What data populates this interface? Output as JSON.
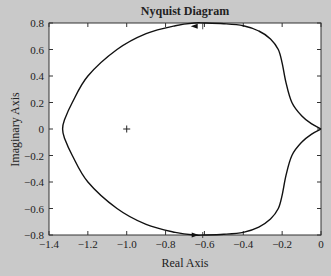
{
  "chart_data": {
    "type": "line",
    "title": "Nyquist Diagram",
    "xlabel": "Real Axis",
    "ylabel": "Imaginary Axis",
    "xlim": [
      -1.4,
      0
    ],
    "ylim": [
      -0.8,
      0.8
    ],
    "xticks": [
      -1.4,
      -1.2,
      -1.0,
      -0.8,
      -0.6,
      -0.4,
      -0.2,
      0
    ],
    "xtick_labels": [
      "−1.4",
      "−1.2",
      "−1.0",
      "−0.8",
      "−0.6",
      "−0.4",
      "−0.2",
      "0"
    ],
    "yticks": [
      0.8,
      0.6,
      0.4,
      0.2,
      0,
      -0.2,
      -0.4,
      -0.6,
      -0.8
    ],
    "ytick_labels": [
      "0.8",
      "0.6",
      "0.4",
      "0.2",
      "0",
      "−0.2",
      "−0.4",
      "−0.6",
      "−0.8"
    ],
    "grid": false,
    "legend": null,
    "series": [
      {
        "name": "Nyquist curve (positive frequencies)",
        "x": [
          0,
          -0.05,
          -0.1,
          -0.15,
          -0.18,
          -0.2,
          -0.22,
          -0.26,
          -0.32,
          -0.4,
          -0.5,
          -0.6,
          -0.65,
          -0.75,
          -0.9,
          -1.05,
          -1.2,
          -1.28,
          -1.32,
          -1.33
        ],
        "y": [
          0,
          -0.04,
          -0.1,
          -0.2,
          -0.35,
          -0.5,
          -0.6,
          -0.68,
          -0.74,
          -0.78,
          -0.795,
          -0.8,
          -0.8,
          -0.78,
          -0.72,
          -0.6,
          -0.4,
          -0.2,
          -0.07,
          0
        ]
      },
      {
        "name": "Nyquist curve (negative frequencies, mirror)",
        "x": [
          0,
          -0.05,
          -0.1,
          -0.15,
          -0.18,
          -0.2,
          -0.22,
          -0.26,
          -0.32,
          -0.4,
          -0.5,
          -0.6,
          -0.65,
          -0.75,
          -0.9,
          -1.05,
          -1.2,
          -1.28,
          -1.32,
          -1.33
        ],
        "y": [
          0,
          0.04,
          0.1,
          0.2,
          0.35,
          0.5,
          0.6,
          0.68,
          0.74,
          0.78,
          0.795,
          0.8,
          0.8,
          0.78,
          0.72,
          0.6,
          0.4,
          0.2,
          0.07,
          0
        ]
      }
    ],
    "annotations": [
      {
        "type": "marker",
        "symbol": "+",
        "x": -1,
        "y": 0,
        "label": "critical point (-1, 0)"
      },
      {
        "type": "arrow",
        "x": -0.65,
        "y": 0.775,
        "direction": "left"
      },
      {
        "type": "arrow",
        "x": -0.65,
        "y": -0.8,
        "direction": "right"
      }
    ]
  }
}
